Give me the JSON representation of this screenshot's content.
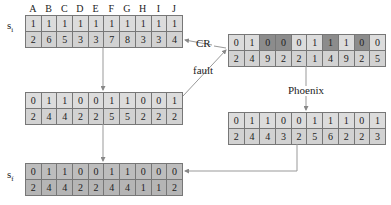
{
  "column_labels": [
    "A",
    "B",
    "C",
    "D",
    "E",
    "F",
    "G",
    "H",
    "I",
    "J"
  ],
  "tables": {
    "s_i": {
      "label": "s",
      "sub": "i",
      "row1": [
        1,
        1,
        1,
        1,
        1,
        1,
        1,
        1,
        1,
        1
      ],
      "row2": [
        2,
        6,
        5,
        3,
        3,
        7,
        8,
        3,
        3,
        4
      ]
    },
    "cr": {
      "row1": [
        0,
        1,
        0,
        0,
        0,
        1,
        1,
        1,
        0,
        0
      ],
      "row2": [
        2,
        4,
        9,
        2,
        2,
        1,
        4,
        9,
        2,
        5
      ],
      "dark_cells": [
        2,
        3,
        6,
        8
      ]
    },
    "fault_result": {
      "row1": [
        0,
        1,
        1,
        0,
        0,
        1,
        1,
        0,
        0,
        1
      ],
      "row2": [
        2,
        4,
        4,
        2,
        2,
        5,
        5,
        2,
        2,
        2
      ]
    },
    "phoenix_result": {
      "row1": [
        0,
        1,
        1,
        0,
        0,
        1,
        1,
        1,
        0,
        1
      ],
      "row2": [
        2,
        4,
        4,
        3,
        2,
        5,
        6,
        2,
        2,
        3
      ]
    },
    "s_f": {
      "label": "s",
      "sub": "f",
      "row1": [
        0,
        1,
        1,
        0,
        0,
        1,
        1,
        0,
        0,
        0
      ],
      "row2": [
        2,
        4,
        4,
        2,
        2,
        4,
        4,
        1,
        1,
        2
      ]
    }
  },
  "edge_labels": {
    "cr": "CR",
    "fault": "fault",
    "phoenix": "Phoenix"
  }
}
